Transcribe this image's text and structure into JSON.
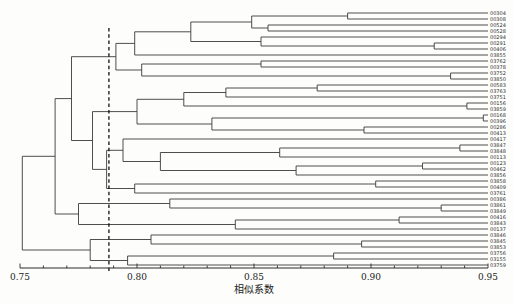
{
  "figure": {
    "background": "#fdfdfb",
    "line_color": "#3a3a3a",
    "text_color": "#1c1c1c"
  },
  "chart_data": {
    "type": "dendrogram",
    "orientation": "right-facing",
    "title": "",
    "xlabel": "相似系数",
    "axis": {
      "min": 0.75,
      "max": 0.95,
      "major_ticks": [
        0.75,
        0.8,
        0.85,
        0.9,
        0.95
      ],
      "tick_labels": [
        "0.75",
        "0.80",
        "0.85",
        "0.90",
        "0.95"
      ],
      "minor_tick_step": 0.01,
      "grid": false
    },
    "threshold_line": {
      "value": 0.788,
      "style": "dashed"
    },
    "leaves": [
      "00304",
      "00308",
      "00524",
      "00528",
      "00294",
      "00291",
      "00406",
      "03855",
      "03762",
      "00378",
      "03752",
      "03850",
      "00583",
      "03763",
      "03751",
      "00156",
      "03859",
      "00168",
      "00396",
      "00286",
      "00413",
      "00417",
      "03847",
      "03848",
      "00113",
      "00123",
      "00462",
      "03856",
      "03858",
      "00409",
      "03761",
      "00386",
      "03861",
      "03849",
      "00416",
      "03843",
      "00137",
      "03846",
      "03845",
      "03853",
      "03756",
      "03155",
      "03759"
    ],
    "tree": {
      "v": 0.751,
      "c": [
        {
          "v": 0.765,
          "c": [
            {
              "v": 0.772,
              "c": [
                {
                  "v": 0.791,
                  "c": [
                    {
                      "v": 0.799,
                      "c": [
                        {
                          "v": 0.823,
                          "c": [
                            {
                              "v": 0.849,
                              "c": [
                                {
                                  "v": 0.89,
                                  "c": [
                                    {
                                      "leaf": 0
                                    },
                                    {
                                      "leaf": 1
                                    }
                                  ]
                                },
                                {
                                  "v": 0.856,
                                  "c": [
                                    {
                                      "leaf": 2
                                    },
                                    {
                                      "leaf": 3
                                    }
                                  ]
                                }
                              ]
                            },
                            {
                              "v": 0.853,
                              "c": [
                                {
                                  "leaf": 4
                                },
                                {
                                  "v": 0.927,
                                  "c": [
                                    {
                                      "leaf": 5
                                    },
                                    {
                                      "leaf": 6
                                    }
                                  ]
                                }
                              ]
                            }
                          ]
                        },
                        {
                          "leaf": 7
                        }
                      ]
                    },
                    {
                      "v": 0.802,
                      "c": [
                        {
                          "v": 0.853,
                          "c": [
                            {
                              "leaf": 8
                            },
                            {
                              "leaf": 9
                            }
                          ]
                        },
                        {
                          "v": 0.934,
                          "c": [
                            {
                              "leaf": 10
                            },
                            {
                              "leaf": 11
                            }
                          ]
                        }
                      ]
                    }
                  ]
                },
                {
                  "v": 0.781,
                  "c": [
                    {
                      "v": 0.8,
                      "c": [
                        {
                          "v": 0.82,
                          "c": [
                            {
                              "v": 0.838,
                              "c": [
                                {
                                  "v": 0.877,
                                  "c": [
                                    {
                                      "leaf": 12
                                    },
                                    {
                                      "leaf": 13
                                    }
                                  ]
                                },
                                {
                                  "leaf": 14
                                }
                              ]
                            },
                            {
                              "v": 0.941,
                              "c": [
                                {
                                  "leaf": 15
                                },
                                {
                                  "leaf": 16
                                }
                              ]
                            }
                          ]
                        },
                        {
                          "v": 0.832,
                          "c": [
                            {
                              "v": 0.948,
                              "c": [
                                {
                                  "leaf": 17
                                },
                                {
                                  "leaf": 18
                                }
                              ]
                            },
                            {
                              "v": 0.897,
                              "c": [
                                {
                                  "leaf": 19
                                },
                                {
                                  "leaf": 20
                                }
                              ]
                            }
                          ]
                        }
                      ]
                    },
                    {
                      "v": 0.787,
                      "c": [
                        {
                          "v": 0.794,
                          "c": [
                            {
                              "leaf": 21
                            },
                            {
                              "v": 0.81,
                              "c": [
                                {
                                  "v": 0.861,
                                  "c": [
                                    {
                                      "v": 0.938,
                                      "c": [
                                        {
                                          "leaf": 22
                                        },
                                        {
                                          "leaf": 23
                                        }
                                      ]
                                    },
                                    {
                                      "leaf": 24
                                    }
                                  ]
                                },
                                {
                                  "v": 0.868,
                                  "c": [
                                    {
                                      "v": 0.922,
                                      "c": [
                                        {
                                          "leaf": 25
                                        },
                                        {
                                          "leaf": 26
                                        }
                                      ]
                                    },
                                    {
                                      "leaf": 27
                                    }
                                  ]
                                }
                              ]
                            }
                          ]
                        },
                        {
                          "v": 0.799,
                          "c": [
                            {
                              "v": 0.902,
                              "c": [
                                {
                                  "leaf": 28
                                },
                                {
                                  "leaf": 29
                                }
                              ]
                            },
                            {
                              "leaf": 30
                            }
                          ]
                        }
                      ]
                    }
                  ]
                }
              ]
            },
            {
              "v": 0.775,
              "c": [
                {
                  "v": 0.814,
                  "c": [
                    {
                      "leaf": 31
                    },
                    {
                      "v": 0.93,
                      "c": [
                        {
                          "leaf": 32
                        },
                        {
                          "leaf": 33
                        }
                      ]
                    }
                  ]
                },
                {
                  "v": 0.842,
                  "c": [
                    {
                      "v": 0.912,
                      "c": [
                        {
                          "leaf": 34
                        },
                        {
                          "leaf": 35
                        }
                      ]
                    },
                    {
                      "leaf": 36
                    }
                  ]
                }
              ]
            }
          ]
        },
        {
          "v": 0.78,
          "c": [
            {
              "v": 0.806,
              "c": [
                {
                  "leaf": 37
                },
                {
                  "v": 0.896,
                  "c": [
                    {
                      "leaf": 38
                    },
                    {
                      "leaf": 39
                    }
                  ]
                }
              ]
            },
            {
              "v": 0.796,
              "c": [
                {
                  "v": 0.884,
                  "c": [
                    {
                      "leaf": 40
                    },
                    {
                      "leaf": 41
                    }
                  ]
                },
                {
                  "leaf": 42
                }
              ]
            }
          ]
        }
      ]
    }
  }
}
